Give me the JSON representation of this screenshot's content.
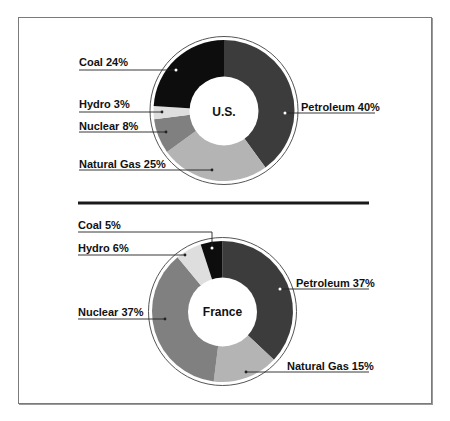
{
  "chart_data": [
    {
      "type": "pie",
      "variant": "donut",
      "title": "U.S.",
      "center_label": "U.S.",
      "start_angle_deg": 0,
      "direction": "clockwise",
      "categories": [
        "Petroleum",
        "Natural Gas",
        "Nuclear",
        "Hydro",
        "Coal"
      ],
      "values": [
        40,
        25,
        8,
        3,
        24
      ],
      "unit": "%",
      "labels": [
        "Petroleum 40%",
        "Natural Gas 25%",
        "Nuclear 8%",
        "Hydro 3%",
        "Coal 24%"
      ],
      "colors": [
        "#3c3c3c",
        "#b4b4b4",
        "#808080",
        "#dedede",
        "#0d0d0d"
      ]
    },
    {
      "type": "pie",
      "variant": "donut",
      "title": "France",
      "center_label": "France",
      "start_angle_deg": 0,
      "direction": "clockwise",
      "categories": [
        "Petroleum",
        "Natural Gas",
        "Nuclear",
        "Hydro",
        "Coal"
      ],
      "values": [
        37,
        15,
        37,
        6,
        5
      ],
      "unit": "%",
      "labels": [
        "Petroleum 37%",
        "Natural Gas 15%",
        "Nuclear 37%",
        "Hydro 6%",
        "Coal 5%"
      ],
      "colors": [
        "#3c3c3c",
        "#b4b4b4",
        "#808080",
        "#dedede",
        "#0d0d0d"
      ]
    }
  ],
  "charts": {
    "us": {
      "center_label": "U.S.",
      "labels": {
        "coal": "Coal 24%",
        "hydro": "Hydro 3%",
        "nuclear": "Nuclear 8%",
        "natural_gas": "Natural Gas 25%",
        "petroleum": "Petroleum 40%"
      }
    },
    "france": {
      "center_label": "France",
      "labels": {
        "coal": "Coal 5%",
        "hydro": "Hydro 6%",
        "nuclear": "Nuclear 37%",
        "natural_gas": "Natural Gas 15%",
        "petroleum": "Petroleum 37%"
      }
    }
  }
}
